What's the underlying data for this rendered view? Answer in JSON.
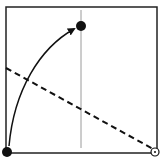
{
  "diagram": {
    "type": "fold-diagram",
    "square": {
      "x": 6,
      "y": 7,
      "w": 151,
      "h": 146,
      "stroke": "#222222"
    },
    "reference_line": {
      "x1": 81,
      "y1": 10,
      "x2": 81,
      "y2": 148,
      "stroke": "#9a9a9a",
      "style": "solid"
    },
    "fold_line": {
      "x1": 6,
      "y1": 68,
      "x2": 155,
      "y2": 150,
      "stroke": "#111111",
      "style": "dashed"
    },
    "arrow": {
      "path": "M9 146 C 14 90, 40 48, 74 29",
      "stroke": "#111111",
      "head": {
        "x": 76,
        "y": 28
      }
    },
    "points": [
      {
        "name": "target-point",
        "cx": 81,
        "cy": 26,
        "r": 5,
        "fill": "#111111",
        "hollow": false
      },
      {
        "name": "moving-corner-point",
        "cx": 7,
        "cy": 152,
        "r": 5,
        "fill": "#111111",
        "hollow": false
      },
      {
        "name": "pivot-point",
        "cx": 155,
        "cy": 152,
        "r": 4,
        "fill": "#ffffff",
        "hollow": true
      }
    ]
  }
}
